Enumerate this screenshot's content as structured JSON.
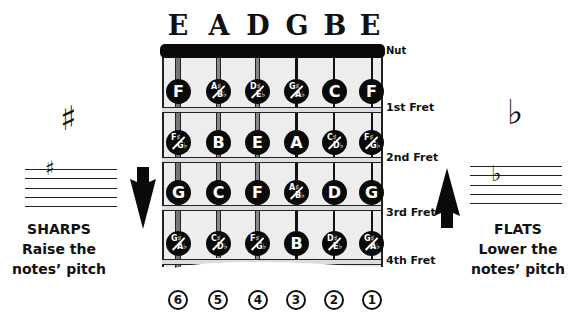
{
  "strings": {
    "names": [
      "E",
      "A",
      "D",
      "G",
      "B",
      "E"
    ],
    "numbers": [
      "6",
      "5",
      "4",
      "3",
      "2",
      "1"
    ]
  },
  "nut_label": "Nut",
  "frets": [
    {
      "label": "1st Fret",
      "notes": [
        {
          "type": "single",
          "name": "F"
        },
        {
          "type": "dual",
          "sharp": "A♯",
          "flat": "B♭"
        },
        {
          "type": "dual",
          "sharp": "D♯",
          "flat": "E♭"
        },
        {
          "type": "dual",
          "sharp": "G♯",
          "flat": "A♭"
        },
        {
          "type": "single",
          "name": "C"
        },
        {
          "type": "single",
          "name": "F"
        }
      ]
    },
    {
      "label": "2nd Fret",
      "notes": [
        {
          "type": "dual",
          "sharp": "F♯",
          "flat": "G♭"
        },
        {
          "type": "single",
          "name": "B"
        },
        {
          "type": "single",
          "name": "E"
        },
        {
          "type": "single",
          "name": "A"
        },
        {
          "type": "dual",
          "sharp": "C♯",
          "flat": "D♭"
        },
        {
          "type": "dual",
          "sharp": "F♯",
          "flat": "G♭"
        }
      ]
    },
    {
      "label": "3rd Fret",
      "notes": [
        {
          "type": "single",
          "name": "G"
        },
        {
          "type": "single",
          "name": "C"
        },
        {
          "type": "single",
          "name": "F"
        },
        {
          "type": "dual",
          "sharp": "A♯",
          "flat": "B♭"
        },
        {
          "type": "single",
          "name": "D"
        },
        {
          "type": "single",
          "name": "G"
        }
      ]
    },
    {
      "label": "4th Fret",
      "notes": [
        {
          "type": "dual",
          "sharp": "G♯",
          "flat": "A♭"
        },
        {
          "type": "dual",
          "sharp": "C♯",
          "flat": "D♭"
        },
        {
          "type": "dual",
          "sharp": "F♯",
          "flat": "G♭"
        },
        {
          "type": "single",
          "name": "B"
        },
        {
          "type": "dual",
          "sharp": "D♯",
          "flat": "E♭"
        },
        {
          "type": "dual",
          "sharp": "G♯",
          "flat": "A♭"
        }
      ]
    }
  ],
  "sharps": {
    "symbol": "♯",
    "title": "SHARPS",
    "line1": "Raise the",
    "line2": "notes’ pitch",
    "arrow": "down-arrow-icon"
  },
  "flats": {
    "symbol": "♭",
    "title": "FLATS",
    "line1": "Lower the",
    "line2": "notes’ pitch",
    "arrow": "up-arrow-icon"
  }
}
